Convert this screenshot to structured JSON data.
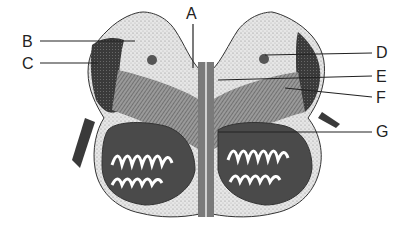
{
  "diagram": {
    "labels": [
      {
        "id": "A",
        "text": "A",
        "x": 186,
        "y": 6
      },
      {
        "id": "B",
        "text": "B",
        "x": 22,
        "y": 34
      },
      {
        "id": "C",
        "text": "C",
        "x": 22,
        "y": 56
      },
      {
        "id": "D",
        "text": "D",
        "x": 376,
        "y": 45
      },
      {
        "id": "E",
        "text": "E",
        "x": 376,
        "y": 69
      },
      {
        "id": "F",
        "text": "F",
        "x": 376,
        "y": 90
      },
      {
        "id": "G",
        "text": "G",
        "x": 376,
        "y": 124
      }
    ],
    "colors": {
      "ink": "#222222",
      "dark_fill": "#3a3a3a",
      "mid_fill": "#8a8a8a",
      "light_fill": "#d9d9d9",
      "background": "#ffffff"
    }
  }
}
